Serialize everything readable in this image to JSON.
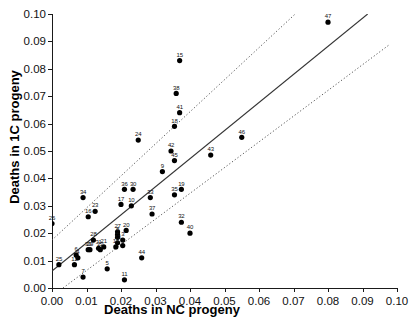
{
  "chart_data": {
    "type": "scatter",
    "title": "",
    "xlabel": "Deaths in NC progeny",
    "ylabel": "Deaths in 1C progeny",
    "xlim": [
      0.0,
      0.1
    ],
    "ylim": [
      0.0,
      0.1
    ],
    "xticks": [
      "0.00",
      "0.01",
      "0.02",
      "0.03",
      "0.04",
      "0.05",
      "0.06",
      "0.07",
      "0.08",
      "0.09",
      "0.10"
    ],
    "yticks": [
      "0.00",
      "0.01",
      "0.02",
      "0.03",
      "0.04",
      "0.05",
      "0.06",
      "0.07",
      "0.08",
      "0.09",
      "0.10"
    ],
    "xtick_values": [
      0.0,
      0.01,
      0.02,
      0.03,
      0.04,
      0.05,
      0.06,
      0.07,
      0.08,
      0.09,
      0.1
    ],
    "ytick_values": [
      0.0,
      0.01,
      0.02,
      0.03,
      0.04,
      0.05,
      0.06,
      0.07,
      0.08,
      0.09,
      0.1
    ],
    "grid": false,
    "legend": "none",
    "marker": "filled-circle",
    "marker_color": "#000000",
    "points": [
      {
        "label": "1",
        "x": 0.0205,
        "y": 0.0155
      },
      {
        "label": "2",
        "x": 0.019,
        "y": 0.0185
      },
      {
        "label": "3",
        "x": 0.0205,
        "y": 0.0175
      },
      {
        "label": "4",
        "x": 0.0075,
        "y": 0.011
      },
      {
        "label": "5",
        "x": 0.016,
        "y": 0.007
      },
      {
        "label": "6",
        "x": 0.007,
        "y": 0.012
      },
      {
        "label": "7",
        "x": 0.009,
        "y": 0.004
      },
      {
        "label": "8",
        "x": 0.019,
        "y": 0.0195
      },
      {
        "label": "9",
        "x": 0.032,
        "y": 0.0425
      },
      {
        "label": "10",
        "x": 0.023,
        "y": 0.03
      },
      {
        "label": "11",
        "x": 0.021,
        "y": 0.003
      },
      {
        "label": "12",
        "x": 0.0065,
        "y": 0.0085
      },
      {
        "label": "13",
        "x": 0.019,
        "y": 0.0165
      },
      {
        "label": "14",
        "x": 0.0185,
        "y": 0.015
      },
      {
        "label": "15",
        "x": 0.037,
        "y": 0.083
      },
      {
        "label": "16",
        "x": 0.0105,
        "y": 0.026
      },
      {
        "label": "17",
        "x": 0.02,
        "y": 0.0305
      },
      {
        "label": "18",
        "x": 0.0355,
        "y": 0.059
      },
      {
        "label": "19",
        "x": 0.0375,
        "y": 0.036
      },
      {
        "label": "20",
        "x": 0.0215,
        "y": 0.021
      },
      {
        "label": "21",
        "x": 0.015,
        "y": 0.015
      },
      {
        "label": "22",
        "x": 0.014,
        "y": 0.014
      },
      {
        "label": "23",
        "x": 0.0125,
        "y": 0.028
      },
      {
        "label": "24",
        "x": 0.025,
        "y": 0.054
      },
      {
        "label": "25",
        "x": 0.002,
        "y": 0.0085
      },
      {
        "label": "26",
        "x": 0.0,
        "y": 0.0235
      },
      {
        "label": "27",
        "x": 0.019,
        "y": 0.0205
      },
      {
        "label": "28",
        "x": 0.012,
        "y": 0.0175
      },
      {
        "label": "29",
        "x": 0.011,
        "y": 0.014
      },
      {
        "label": "30",
        "x": 0.0235,
        "y": 0.036
      },
      {
        "label": "31",
        "x": 0.0135,
        "y": 0.0145
      },
      {
        "label": "32",
        "x": 0.0375,
        "y": 0.024
      },
      {
        "label": "33",
        "x": 0.0285,
        "y": 0.033
      },
      {
        "label": "34",
        "x": 0.009,
        "y": 0.033
      },
      {
        "label": "35",
        "x": 0.0355,
        "y": 0.034
      },
      {
        "label": "36",
        "x": 0.021,
        "y": 0.036
      },
      {
        "label": "37",
        "x": 0.029,
        "y": 0.027
      },
      {
        "label": "38",
        "x": 0.036,
        "y": 0.071
      },
      {
        "label": "39",
        "x": 0.0105,
        "y": 0.014
      },
      {
        "label": "40",
        "x": 0.04,
        "y": 0.02
      },
      {
        "label": "41",
        "x": 0.037,
        "y": 0.064
      },
      {
        "label": "42",
        "x": 0.0345,
        "y": 0.05
      },
      {
        "label": "43",
        "x": 0.046,
        "y": 0.0485
      },
      {
        "label": "44",
        "x": 0.026,
        "y": 0.011
      },
      {
        "label": "45",
        "x": 0.0355,
        "y": 0.0465
      },
      {
        "label": "46",
        "x": 0.055,
        "y": 0.055
      },
      {
        "label": "47",
        "x": 0.08,
        "y": 0.097
      }
    ],
    "fit_line": {
      "style": "solid",
      "color": "#333333",
      "x0": 0.0,
      "y0": 0.0062,
      "x1": 0.0915,
      "y1": 0.1
    },
    "confidence_band_upper": {
      "style": "dotted",
      "color": "#555555",
      "x0": 0.0,
      "y0": 0.0175,
      "x1": 0.0705,
      "y1": 0.1
    },
    "confidence_band_lower": {
      "style": "dotted",
      "color": "#555555",
      "x0": 0.0032,
      "y0": 0.0,
      "x1": 0.098,
      "y1": 0.089
    }
  }
}
